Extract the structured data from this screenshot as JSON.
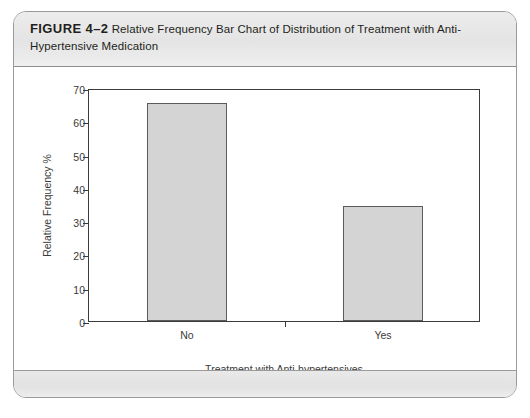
{
  "figure": {
    "label": "FIGURE 4–2",
    "caption": "Relative Frequency Bar Chart of Distribution of Treatment with Anti-Hypertensive Medication"
  },
  "chart_data": {
    "type": "bar",
    "title": "",
    "categories": [
      "No",
      "Yes"
    ],
    "values": [
      65.5,
      34.5
    ],
    "xlabel": "Treatment with Anti-hypertensives",
    "ylabel": "Relative Frequency %",
    "ylim": [
      0,
      70
    ],
    "yticks": [
      0,
      10,
      20,
      30,
      40,
      50,
      60,
      70
    ],
    "ytick_labels": [
      "0",
      "10",
      "20",
      "30",
      "40",
      "50",
      "60",
      "70"
    ],
    "grid": false,
    "legend": false,
    "bar_fill_color": "#d4d4d4",
    "bar_edge_color": "#5b5b5b",
    "axis_color": "#3b3b3b"
  }
}
